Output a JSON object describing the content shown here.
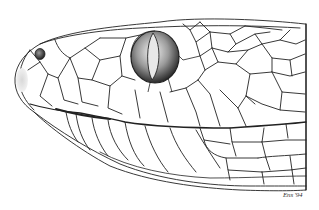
{
  "image": {
    "subject": "Pen-and-ink illustration of a snake head (pit viper) in lateral view",
    "signature": "Ens '94",
    "colors": {
      "background": "#ffffff",
      "ink": "#222222",
      "stipple": "#444444"
    }
  }
}
